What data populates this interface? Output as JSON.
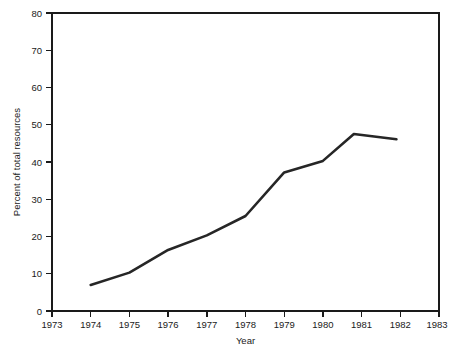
{
  "chart_data": {
    "type": "line",
    "title": "",
    "xlabel": "Year",
    "ylabel": "Percent of total resources",
    "xlim": [
      1973,
      1983
    ],
    "ylim": [
      0,
      80
    ],
    "grid": false,
    "legend": false,
    "x_ticks": [
      "1973",
      "1974",
      "1975",
      "1976",
      "1977",
      "1978",
      "1979",
      "1980",
      "1981",
      "1982",
      "1983"
    ],
    "y_ticks": [
      "0",
      "10",
      "20",
      "30",
      "40",
      "50",
      "60",
      "70",
      "80"
    ],
    "x": [
      1974,
      1975,
      1976,
      1977,
      1978,
      1979,
      1980,
      1980.8,
      1981.9
    ],
    "values": [
      7,
      10.3,
      16.4,
      20.3,
      25.5,
      37.2,
      40.3,
      47.5,
      46.1
    ],
    "series": [
      {
        "name": "Percent of total resources",
        "color": "#262626",
        "x": [
          1974,
          1975,
          1976,
          1977,
          1978,
          1979,
          1980,
          1980.8,
          1981.9
        ],
        "values": [
          7,
          10.3,
          16.4,
          20.3,
          25.5,
          37.2,
          40.3,
          47.5,
          46.1
        ]
      }
    ]
  },
  "axes": {
    "x_title": "Year",
    "y_title": "Percent of total resources"
  }
}
